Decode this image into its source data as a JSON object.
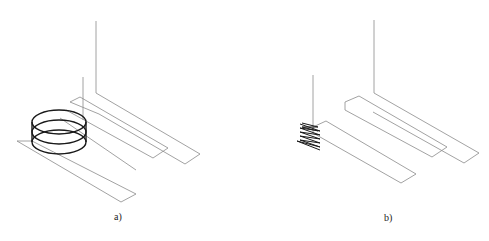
{
  "figure": {
    "panels": [
      {
        "id": "a",
        "caption": "a)",
        "description": "Three parallel strip conductors with a cylindrical multi-turn coil around the first strip"
      },
      {
        "id": "b",
        "caption": "b)",
        "description": "Three parallel strip conductors with a compressed zig-zag winding at the start of the first strip"
      }
    ],
    "colors": {
      "line": "#8a8a8a",
      "coil": "#1a1a1a",
      "background": "#ffffff"
    }
  }
}
